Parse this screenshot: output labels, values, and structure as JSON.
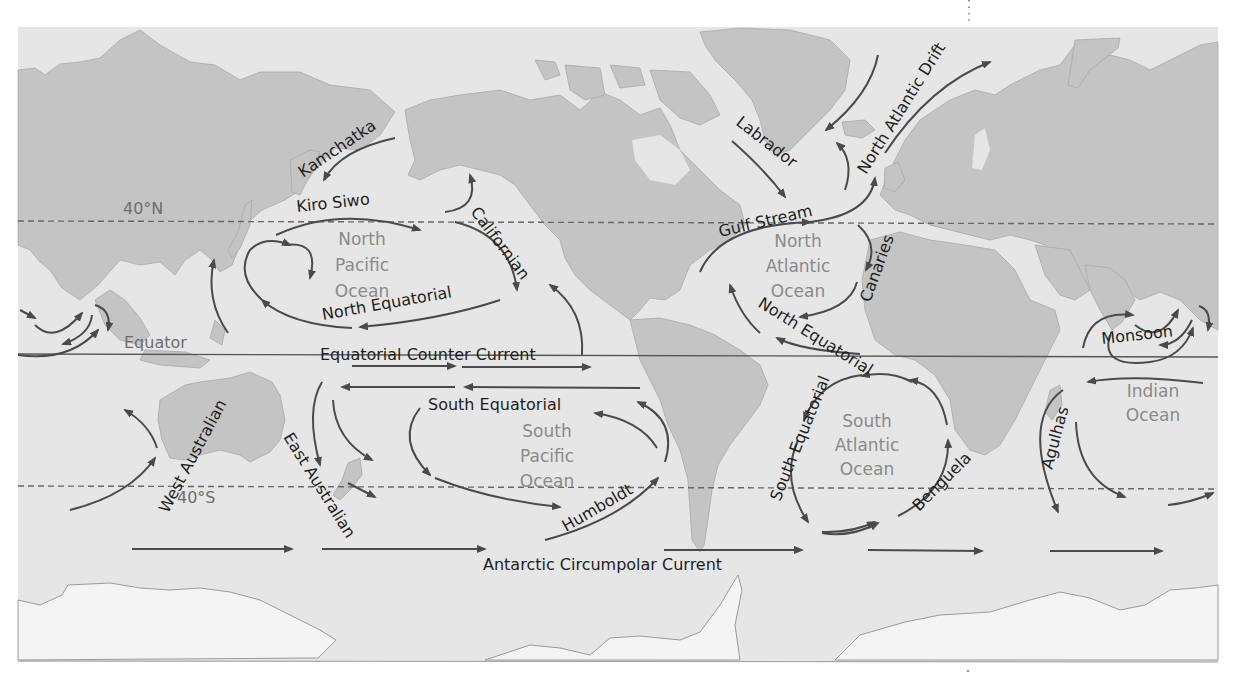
{
  "colors": {
    "ocean": "#e6e6e6",
    "land": "#c4c4c4",
    "ice": "#f4f4f4",
    "current_arrow": "#4a4a4a",
    "label_text": "#1e1e1e",
    "ocean_label_text": "#8a8a8a",
    "latitude_line": "#666666"
  },
  "latitude_lines": [
    {
      "name": "40N",
      "label": "40°N"
    },
    {
      "name": "equator",
      "label": "Equator"
    },
    {
      "name": "40S",
      "label": "40°S"
    }
  ],
  "oceans": {
    "north_pacific": [
      "North",
      "Pacific",
      "Ocean"
    ],
    "south_pacific": [
      "South",
      "Pacific",
      "Ocean"
    ],
    "north_atlantic": [
      "North",
      "Atlantic",
      "Ocean"
    ],
    "south_atlantic": [
      "South",
      "Atlantic",
      "Ocean"
    ],
    "indian": [
      "Indian",
      "Ocean"
    ]
  },
  "currents": {
    "kamchatka": "Kamchatka",
    "kiro_siwo": "Kiro Siwo",
    "californian": "Californian",
    "north_equatorial_pacific": "North Equatorial",
    "equatorial_counter": "Equatorial Counter Current",
    "south_equatorial_pacific": "South Equatorial",
    "west_australian": "West Australian",
    "east_australian": "East Australian",
    "humboldt": "Humboldt",
    "antarctic_circumpolar": "Antarctic Circumpolar Current",
    "labrador": "Labrador",
    "gulf_stream": "Gulf Stream",
    "north_atlantic_drift": "North Atlantic Drift",
    "canaries": "Canaries",
    "north_equatorial_atlantic": "North Equatorial",
    "south_equatorial_atlantic": "South Equatorial",
    "benguela": "Benguela",
    "agulhas": "Agulhas",
    "monsoon": "Monsoon"
  }
}
